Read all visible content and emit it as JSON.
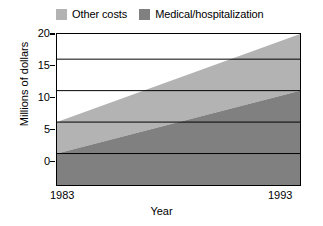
{
  "chart_data": {
    "type": "area",
    "stacked": true,
    "title": "",
    "subtitle": "",
    "xlabel": "Year",
    "ylabel": "Millions of dollars",
    "x": [
      1983,
      1993
    ],
    "xlim": [
      1983,
      1993
    ],
    "xticks": [
      1983,
      1993
    ],
    "xticklabels": [
      "1983",
      "1993"
    ],
    "ylim": [
      0,
      24
    ],
    "yticks": [
      0,
      5,
      10,
      15,
      20
    ],
    "yticklabels": [
      "0",
      "5",
      "10",
      "15",
      "20"
    ],
    "grid": true,
    "grid_axis": "y",
    "legend_position": "top-left",
    "series": [
      {
        "name": "Medical/hospitalization",
        "values": [
          5,
          15
        ],
        "color": "#808080",
        "stack_bottom": [
          0,
          0
        ],
        "stack_top": [
          5,
          15
        ]
      },
      {
        "name": "Other costs",
        "values": [
          5,
          9
        ],
        "color": "#b3b3b3",
        "stack_bottom": [
          5,
          15
        ],
        "stack_top": [
          10,
          24
        ]
      }
    ],
    "totals": [
      10,
      24
    ],
    "annotations": []
  },
  "legend": {
    "entries": [
      {
        "label": "Other costs",
        "color": "#b3b3b3"
      },
      {
        "label": "Medical/hospitalization",
        "color": "#808080"
      }
    ]
  },
  "axes": {
    "y_title": "Millions of dollars",
    "x_title": "Year",
    "y_ticks": [
      "20",
      "15",
      "10",
      "5",
      "0"
    ],
    "x_ticks": {
      "start": "1983",
      "end": "1993"
    }
  },
  "colors": {
    "other_costs": "#b3b3b3",
    "medical": "#808080",
    "frame": "#000000",
    "gridline": "#000000",
    "background": "#ffffff"
  }
}
